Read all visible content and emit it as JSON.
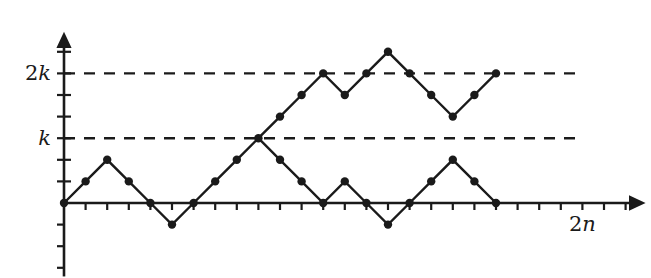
{
  "figure": {
    "background_color": "#ffffff",
    "ink_color": "#1a1a1a"
  },
  "axes": {
    "origin_px": [
      64,
      203
    ],
    "unit_px": 21.6,
    "x_axis": {
      "label": "2n",
      "label_anchor_x": 24,
      "arrow": true,
      "tick_count": 26,
      "tick_length_px": 7,
      "tick_side": "below"
    },
    "y_axis": {
      "arrow": true,
      "tick_count_up": 7,
      "tick_count_down": 3,
      "tick_length_px": 7,
      "tick_side": "left",
      "labels": [
        {
          "text": "2k",
          "value": 6
        },
        {
          "text": "k",
          "value": 3
        }
      ]
    }
  },
  "guides": [
    {
      "name": "level-2k",
      "value": 6,
      "style": "dashed",
      "label": "2k",
      "x_from": 0,
      "x_to": 24
    },
    {
      "name": "level-k",
      "value": 3,
      "style": "dashed",
      "label": "k",
      "x_from": 0,
      "x_to": 24
    }
  ],
  "chart_data": {
    "type": "line",
    "xlabel": "2n",
    "ylabel": "",
    "xlim": [
      0,
      26
    ],
    "ylim": [
      -3,
      7
    ],
    "grid": false,
    "legend": "none",
    "annotations": [
      {
        "text": "2k",
        "x": -1,
        "y": 6
      },
      {
        "text": "k",
        "x": -1,
        "y": 3
      },
      {
        "text": "2n",
        "x": 24,
        "y": -1
      }
    ],
    "x": [
      0,
      1,
      2,
      3,
      4,
      5,
      6,
      7,
      8,
      9,
      10,
      11,
      12,
      13,
      14,
      15,
      16,
      17,
      18,
      19,
      20,
      21,
      22,
      23,
      24
    ],
    "series": [
      {
        "name": "upper-path",
        "marker": "filled-circle",
        "x": [
          0,
          1,
          2,
          3,
          4,
          5,
          6,
          7,
          8,
          9,
          10,
          11,
          12,
          13,
          14,
          15,
          16,
          17,
          18,
          19,
          20,
          21,
          22,
          23,
          24
        ],
        "values": [
          0,
          1,
          2,
          1,
          0,
          -1,
          0,
          1,
          2,
          3,
          4,
          5,
          6,
          5,
          6,
          7,
          6,
          5,
          4,
          5,
          6,
          6,
          6,
          6,
          6
        ]
      },
      {
        "name": "lower-path",
        "marker": "filled-circle",
        "x": [
          0,
          1,
          2,
          3,
          4,
          5,
          6,
          7,
          8,
          9,
          10,
          11,
          12,
          13,
          14,
          15,
          16,
          17,
          18,
          19,
          20,
          21,
          22,
          23,
          24
        ],
        "values": [
          0,
          1,
          2,
          1,
          0,
          -1,
          0,
          1,
          2,
          3,
          2,
          1,
          0,
          1,
          0,
          -1,
          0,
          1,
          2,
          1,
          0,
          0,
          0,
          0,
          0
        ]
      }
    ],
    "paths": [
      {
        "name": "common-prefix",
        "points": [
          [
            0,
            0
          ],
          [
            1,
            1
          ],
          [
            2,
            2
          ],
          [
            3,
            1
          ],
          [
            4,
            0
          ],
          [
            5,
            -1
          ],
          [
            6,
            0
          ],
          [
            7,
            1
          ],
          [
            8,
            2
          ],
          [
            9,
            3
          ]
        ]
      },
      {
        "name": "upper-branch",
        "points": [
          [
            9,
            3
          ],
          [
            10,
            4
          ],
          [
            11,
            5
          ],
          [
            12,
            6
          ],
          [
            13,
            5
          ],
          [
            14,
            6
          ],
          [
            15,
            7
          ],
          [
            16,
            6
          ],
          [
            17,
            5
          ],
          [
            18,
            4
          ],
          [
            19,
            5
          ],
          [
            20,
            6
          ]
        ]
      },
      {
        "name": "lower-branch",
        "points": [
          [
            9,
            3
          ],
          [
            10,
            2
          ],
          [
            11,
            1
          ],
          [
            12,
            0
          ],
          [
            13,
            1
          ],
          [
            14,
            0
          ],
          [
            15,
            -1
          ],
          [
            16,
            0
          ],
          [
            17,
            1
          ],
          [
            18,
            2
          ],
          [
            19,
            1
          ],
          [
            20,
            0
          ]
        ]
      }
    ],
    "vertices": {
      "common": [
        [
          0,
          0
        ],
        [
          1,
          1
        ],
        [
          2,
          2
        ],
        [
          3,
          1
        ],
        [
          4,
          0
        ],
        [
          5,
          -1
        ],
        [
          6,
          0
        ],
        [
          7,
          1
        ],
        [
          8,
          2
        ],
        [
          9,
          3
        ]
      ],
      "upper": [
        [
          10,
          4
        ],
        [
          11,
          5
        ],
        [
          12,
          6
        ],
        [
          13,
          5
        ],
        [
          14,
          6
        ],
        [
          15,
          7
        ],
        [
          16,
          6
        ],
        [
          17,
          5
        ],
        [
          18,
          4
        ],
        [
          19,
          5
        ],
        [
          20,
          6
        ]
      ],
      "lower": [
        [
          10,
          2
        ],
        [
          11,
          1
        ],
        [
          12,
          0
        ],
        [
          13,
          1
        ],
        [
          14,
          0
        ],
        [
          15,
          -1
        ],
        [
          16,
          0
        ],
        [
          17,
          1
        ],
        [
          18,
          2
        ],
        [
          19,
          1
        ],
        [
          20,
          0
        ]
      ]
    },
    "dot_radius_px": 4.2
  }
}
